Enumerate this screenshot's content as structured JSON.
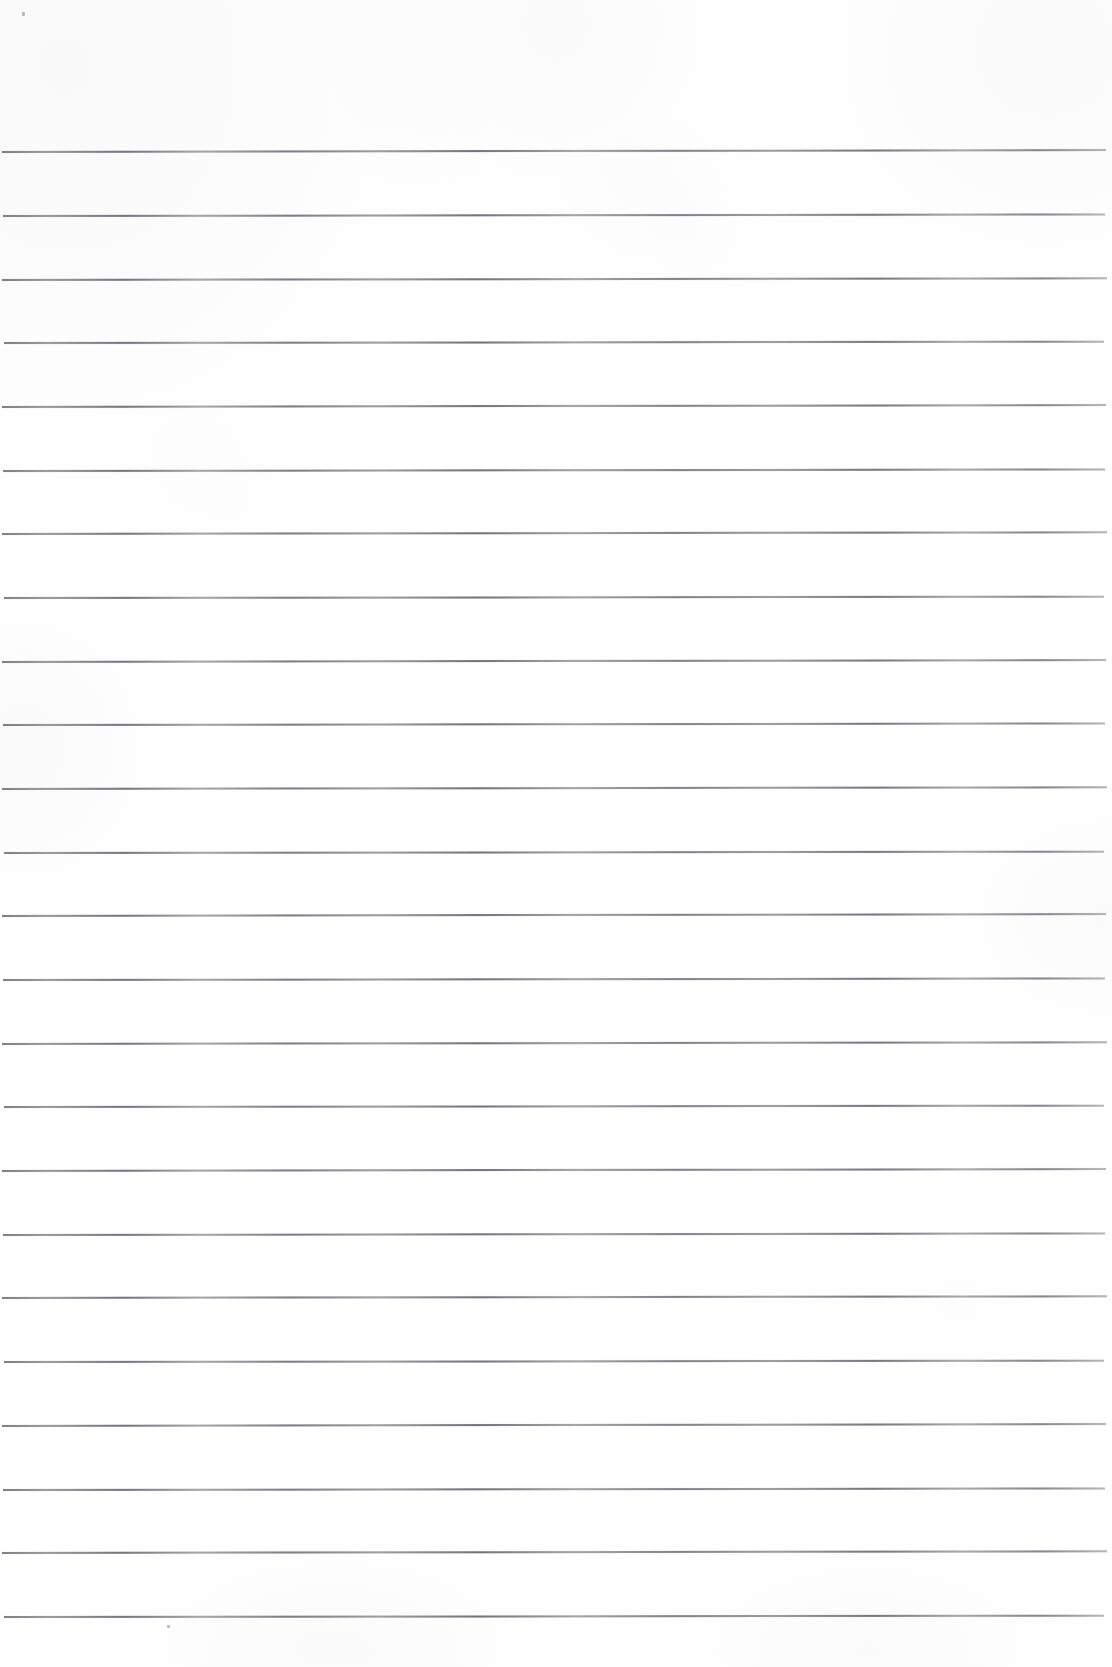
{
  "document": {
    "kind": "scanned-blank-ruled-page",
    "title": "Blank lined notebook page (scan)",
    "page_width": 1112,
    "page_height": 1667,
    "paper_color": "#ffffff",
    "rule_color": "#76767c",
    "text_content": "",
    "handwriting_present": "no",
    "printed_text_present": "no"
  },
  "ruling": {
    "line_count": 24,
    "line_spacing_px": 63.7,
    "first_line_y": 151,
    "last_line_y": 1616,
    "line_thickness_px": 1.5,
    "top_margin_px": 151,
    "bottom_margin_px": 51,
    "left_inset_px": 2,
    "right_inset_px": 7,
    "lines": [
      {
        "index": 1,
        "y": 151,
        "x_start": 2,
        "x_end": 1106,
        "tilt_deg": -0.1
      },
      {
        "index": 2,
        "y": 215,
        "x_start": 3,
        "x_end": 1105,
        "tilt_deg": -0.08
      },
      {
        "index": 3,
        "y": 279,
        "x_start": 2,
        "x_end": 1107,
        "tilt_deg": -0.09
      },
      {
        "index": 4,
        "y": 342,
        "x_start": 4,
        "x_end": 1104,
        "tilt_deg": -0.07
      },
      {
        "index": 5,
        "y": 406,
        "x_start": 2,
        "x_end": 1106,
        "tilt_deg": -0.1
      },
      {
        "index": 6,
        "y": 470,
        "x_start": 3,
        "x_end": 1105,
        "tilt_deg": -0.08
      },
      {
        "index": 7,
        "y": 533,
        "x_start": 2,
        "x_end": 1107,
        "tilt_deg": -0.09
      },
      {
        "index": 8,
        "y": 597,
        "x_start": 4,
        "x_end": 1104,
        "tilt_deg": -0.07
      },
      {
        "index": 9,
        "y": 661,
        "x_start": 2,
        "x_end": 1106,
        "tilt_deg": -0.1
      },
      {
        "index": 10,
        "y": 724,
        "x_start": 3,
        "x_end": 1105,
        "tilt_deg": -0.08
      },
      {
        "index": 11,
        "y": 788,
        "x_start": 2,
        "x_end": 1107,
        "tilt_deg": -0.09
      },
      {
        "index": 12,
        "y": 852,
        "x_start": 4,
        "x_end": 1104,
        "tilt_deg": -0.07
      },
      {
        "index": 13,
        "y": 915,
        "x_start": 2,
        "x_end": 1106,
        "tilt_deg": -0.1
      },
      {
        "index": 14,
        "y": 979,
        "x_start": 3,
        "x_end": 1105,
        "tilt_deg": -0.08
      },
      {
        "index": 15,
        "y": 1043,
        "x_start": 2,
        "x_end": 1107,
        "tilt_deg": -0.09
      },
      {
        "index": 16,
        "y": 1106,
        "x_start": 4,
        "x_end": 1104,
        "tilt_deg": -0.07
      },
      {
        "index": 17,
        "y": 1170,
        "x_start": 2,
        "x_end": 1106,
        "tilt_deg": -0.1
      },
      {
        "index": 18,
        "y": 1234,
        "x_start": 3,
        "x_end": 1105,
        "tilt_deg": -0.08
      },
      {
        "index": 19,
        "y": 1297,
        "x_start": 2,
        "x_end": 1107,
        "tilt_deg": -0.09
      },
      {
        "index": 20,
        "y": 1361,
        "x_start": 4,
        "x_end": 1104,
        "tilt_deg": -0.07
      },
      {
        "index": 21,
        "y": 1425,
        "x_start": 2,
        "x_end": 1106,
        "tilt_deg": -0.1
      },
      {
        "index": 22,
        "y": 1489,
        "x_start": 3,
        "x_end": 1105,
        "tilt_deg": -0.08
      },
      {
        "index": 23,
        "y": 1552,
        "x_start": 2,
        "x_end": 1107,
        "tilt_deg": -0.09
      },
      {
        "index": 24,
        "y": 1616,
        "x_start": 4,
        "x_end": 1104,
        "tilt_deg": -0.07
      }
    ]
  },
  "artifacts": {
    "specks": [
      {
        "name": "speck-top-left",
        "x": 22,
        "y": 12,
        "w": 3,
        "h": 4
      },
      {
        "name": "speck-bottom-mid",
        "x": 167,
        "y": 1625,
        "w": 3,
        "h": 3
      }
    ]
  }
}
